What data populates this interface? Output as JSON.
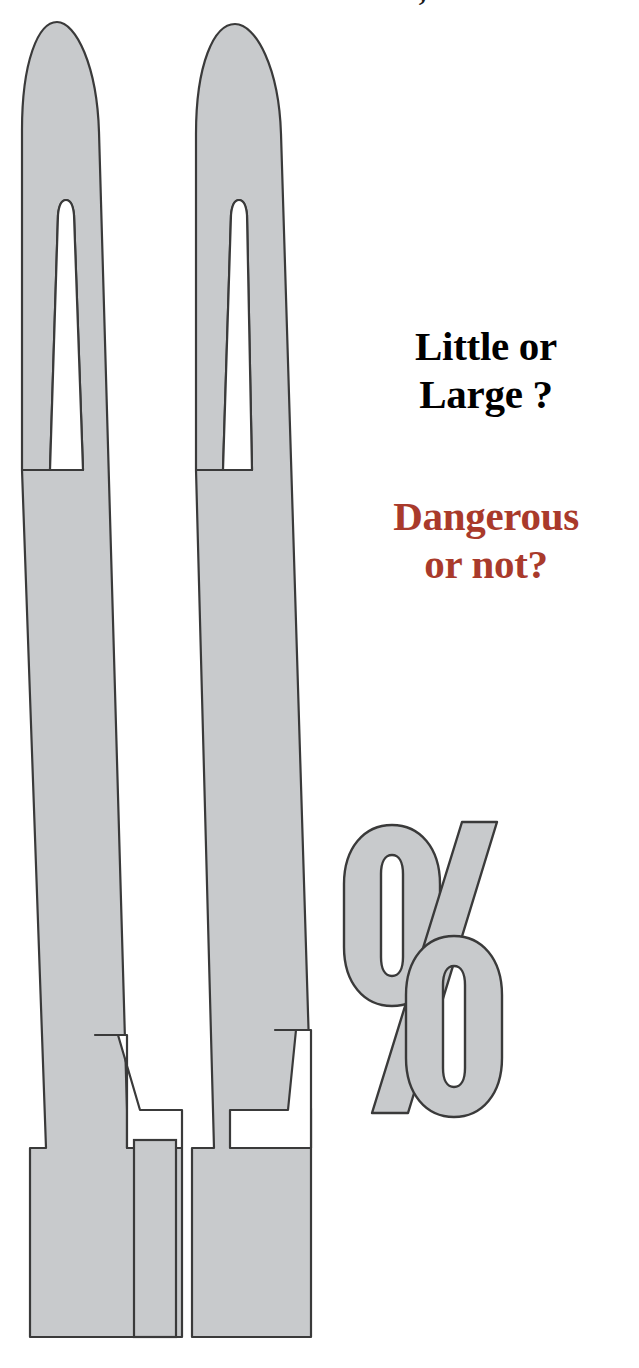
{
  "page": {
    "width": 639,
    "height": 1368,
    "background_color": "#FFFFFF"
  },
  "top_clipped_headline": {
    "text": "small, but...",
    "note": "cropped at top edge of page, only lower few pixels of glyphs visible",
    "color": "#1A1A1A"
  },
  "headlines": [
    {
      "id": "little-or-large",
      "text": "Little or\nLarge ?",
      "color": "#000000",
      "style": "bold-serif"
    },
    {
      "id": "dangerous-or-not",
      "text": "Dangerous\nor not?",
      "color": "#A93A2B",
      "style": "bold-serif"
    }
  ],
  "artwork": {
    "description": "Two tall stylised exclamation-mark / thermometer shapes with rounded tops, a long narrow slit, and blocky stepped feet; plus a small rectangular bar between the feet, and a large outlined percent sign.",
    "fill_color": "#C8CACC",
    "stroke_color": "#3A3A3A",
    "stroke_width": 2,
    "shapes": [
      {
        "name": "left-tall-mark",
        "kind": "exclamation-stroke"
      },
      {
        "name": "right-tall-mark",
        "kind": "exclamation-stroke"
      },
      {
        "name": "center-small-bar",
        "kind": "rectangle"
      },
      {
        "name": "percent-sign",
        "kind": "percent-glyph"
      }
    ]
  },
  "colors": {
    "gray_fill": "#C8CACC",
    "outline": "#3A3A3A",
    "accent_red": "#A93A2B",
    "text_black": "#000000",
    "background": "#FFFFFF"
  }
}
